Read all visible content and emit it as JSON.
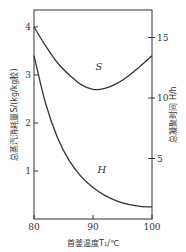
{
  "chart_data": {
    "type": "line",
    "title": "",
    "xlabel": "首釜温度T1/℃",
    "ylabel_left": "总蒸汽消耗量S/(kg/kg胶)",
    "ylabel_right": "总凝聚时间 H/h",
    "xlim": [
      80,
      100
    ],
    "ylim_left": [
      0,
      4
    ],
    "ylim_right": [
      0,
      18
    ],
    "x_ticks": [
      "80",
      "90",
      "100"
    ],
    "y_ticks_left": [
      "1",
      "2",
      "3",
      "4"
    ],
    "y_ticks_right": [
      "5",
      "10",
      "15"
    ],
    "grid": false,
    "legend": "inline curve labels",
    "series": [
      {
        "name": "S",
        "axis": "left",
        "x": [
          80,
          82,
          84,
          86,
          88,
          90,
          92,
          94,
          96,
          98,
          100
        ],
        "values": [
          4.0,
          3.6,
          3.25,
          3.0,
          2.8,
          2.7,
          2.72,
          2.82,
          2.98,
          3.18,
          3.4
        ]
      },
      {
        "name": "H",
        "axis": "right",
        "x": [
          80,
          82,
          84,
          86,
          88,
          90,
          92,
          94,
          96,
          98,
          100
        ],
        "values": [
          13.5,
          9.5,
          6.7,
          4.8,
          3.5,
          2.6,
          1.95,
          1.5,
          1.2,
          1.05,
          1.0
        ]
      }
    ],
    "annotations": [
      {
        "text": "S",
        "x": 91,
        "y_left": 3.1
      },
      {
        "text": "H",
        "x": 91.5,
        "y_left": 0.95
      }
    ]
  },
  "labels": {
    "x_axis": "首釜温度T₁/℃",
    "y_left": "总蒸汽消耗量S/(kg/kg胶)",
    "y_right": "总凝聚时间 H/h",
    "curve_s": "S",
    "curve_h": "H"
  }
}
